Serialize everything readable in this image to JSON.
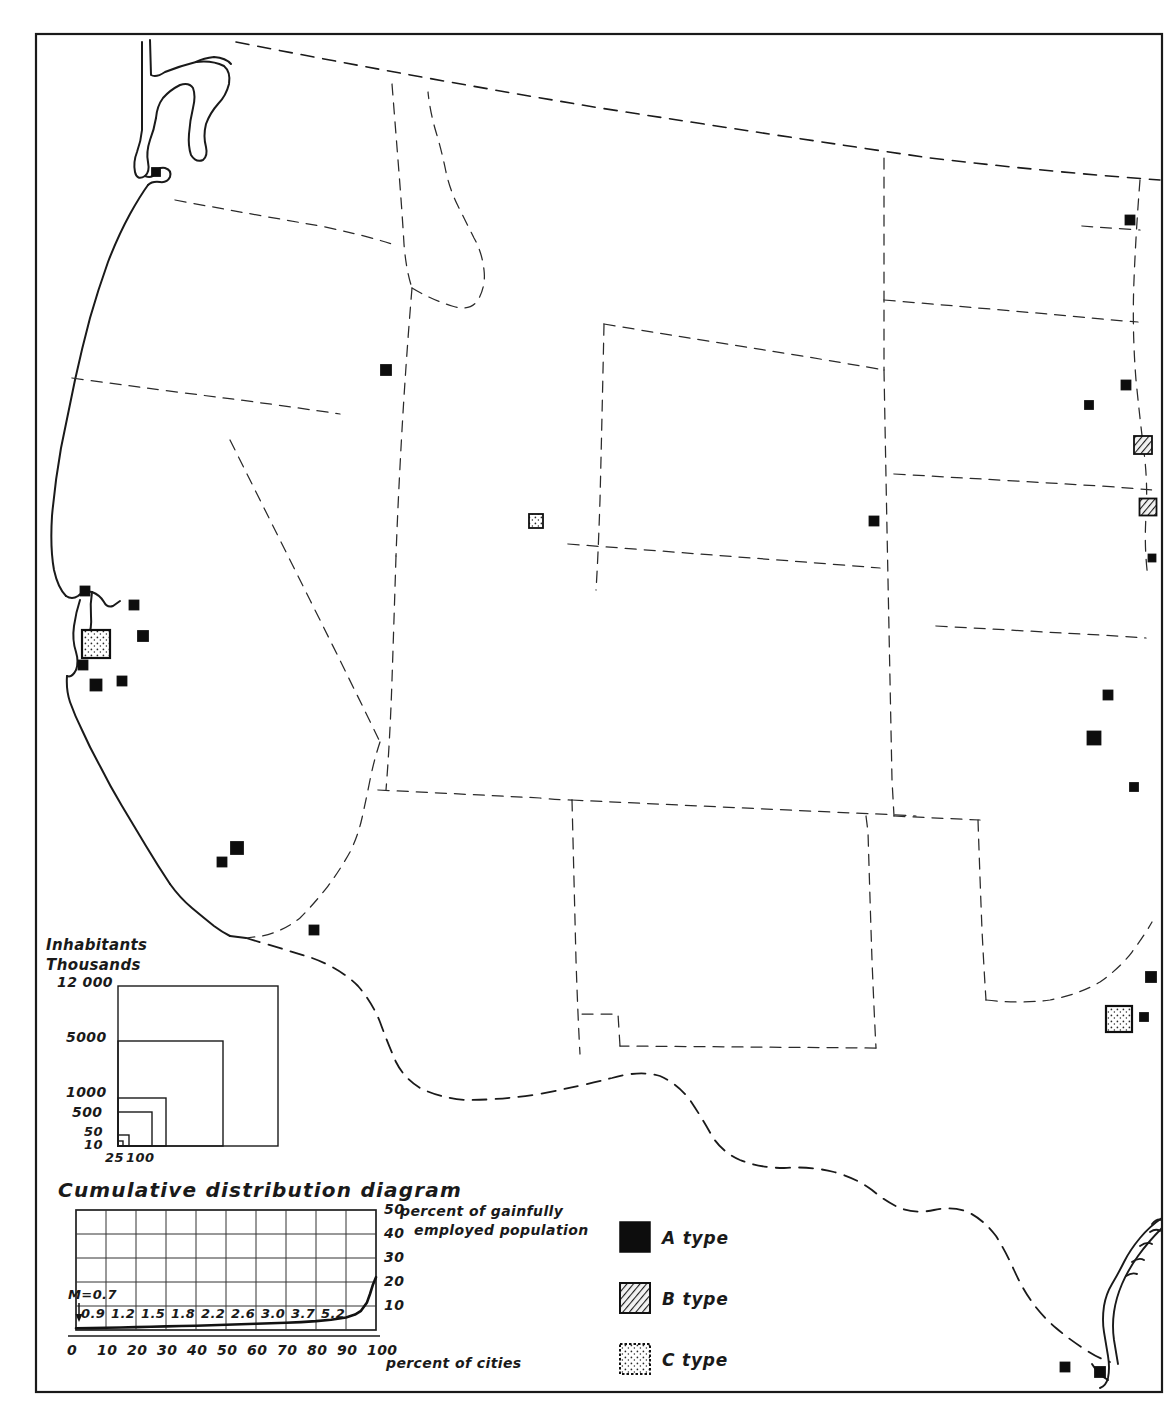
{
  "figure": {
    "kind": "map-with-legends",
    "region": "Western United States",
    "frame_color": "#1a1a1a",
    "background": "#ffffff"
  },
  "inhabitants_legend": {
    "title_line1": "Inhabitants",
    "title_line2": "Thousands",
    "vertical_labels": [
      "12 000",
      "5000",
      "1000",
      "500",
      "50",
      "10"
    ],
    "horizontal_labels": [
      "25",
      "100"
    ],
    "squares": [
      {
        "value": "12 000",
        "side": 160
      },
      {
        "value": "5000",
        "side": 105
      },
      {
        "value": "1000",
        "side": 48
      },
      {
        "value": "500",
        "side": 34
      },
      {
        "value": "50",
        "side": 11
      },
      {
        "value": "10",
        "side": 5
      }
    ]
  },
  "chart_data": {
    "type": "line",
    "title": "Cumulative distribution diagram",
    "xlabel": "percent of cities",
    "ylabel_line1": "percent of gainfully",
    "ylabel_line2": "employed population",
    "xlim": [
      0,
      100
    ],
    "ylim": [
      0,
      50
    ],
    "xticks": [
      "0",
      "10",
      "20",
      "30",
      "40",
      "50",
      "60",
      "70",
      "80",
      "90",
      "100"
    ],
    "yticks": [
      "10",
      "20",
      "30",
      "40",
      "50"
    ],
    "grid": true,
    "legend": "none",
    "annotation": "M=0.7",
    "point_labels": [
      "0.9",
      "1.2",
      "1.5",
      "1.8",
      "2.2",
      "2.6",
      "3.0",
      "3.7",
      "5.2"
    ],
    "x": [
      0,
      5,
      10,
      15,
      20,
      25,
      30,
      35,
      40,
      45,
      50,
      55,
      60,
      65,
      70,
      75,
      80,
      85,
      90,
      93,
      95,
      97,
      98,
      99,
      100
    ],
    "y": [
      0.7,
      0.8,
      0.9,
      1.05,
      1.2,
      1.35,
      1.5,
      1.65,
      1.8,
      2.0,
      2.2,
      2.4,
      2.6,
      2.8,
      3.0,
      3.3,
      3.7,
      4.3,
      5.2,
      6.4,
      8.0,
      11.5,
      15.0,
      19.0,
      22.0
    ]
  },
  "type_legend": {
    "items": [
      {
        "key": "A",
        "label": "A type",
        "pattern": "solid-black",
        "color": "#0d0d0d"
      },
      {
        "key": "B",
        "label": "B type",
        "pattern": "diagonal-hatch",
        "color": "#3a3a3a"
      },
      {
        "key": "C",
        "label": "C type",
        "pattern": "stipple-dots",
        "color": "#ffffff"
      }
    ]
  },
  "map_symbols": [
    {
      "name": "portland-astoria",
      "type": "A",
      "x": 156,
      "y": 172,
      "size": 8
    },
    {
      "name": "boise",
      "type": "A",
      "x": 386,
      "y": 370,
      "size": 10
    },
    {
      "name": "salt-lake-city",
      "type": "C",
      "x": 536,
      "y": 521,
      "size": 14
    },
    {
      "name": "sacramento",
      "type": "A",
      "x": 134,
      "y": 605,
      "size": 9
    },
    {
      "name": "reno",
      "type": "A",
      "x": 143,
      "y": 636,
      "size": 10
    },
    {
      "name": "san-francisco-bay",
      "type": "C",
      "x": 96,
      "y": 644,
      "size": 28
    },
    {
      "name": "san-jose",
      "type": "A",
      "x": 83,
      "y": 665,
      "size": 9
    },
    {
      "name": "stockton",
      "type": "A",
      "x": 122,
      "y": 681,
      "size": 9
    },
    {
      "name": "fresno",
      "type": "A",
      "x": 96,
      "y": 685,
      "size": 11
    },
    {
      "name": "bakersfield",
      "type": "A",
      "x": 85,
      "y": 591,
      "size": 9
    },
    {
      "name": "los-angeles",
      "type": "A",
      "x": 237,
      "y": 848,
      "size": 12
    },
    {
      "name": "san-diego",
      "type": "A",
      "x": 222,
      "y": 862,
      "size": 9
    },
    {
      "name": "tucson",
      "type": "A",
      "x": 314,
      "y": 930,
      "size": 9
    },
    {
      "name": "denver",
      "type": "A",
      "x": 874,
      "y": 521,
      "size": 9
    },
    {
      "name": "billings",
      "type": "A",
      "x": 1130,
      "y": 220,
      "size": 9
    },
    {
      "name": "bismarck",
      "type": "A",
      "x": 1126,
      "y": 385,
      "size": 9
    },
    {
      "name": "rapid-city",
      "type": "A",
      "x": 1089,
      "y": 405,
      "size": 8
    },
    {
      "name": "omaha",
      "type": "B",
      "x": 1143,
      "y": 445,
      "size": 18
    },
    {
      "name": "kansas-city",
      "type": "B",
      "x": 1148,
      "y": 507,
      "size": 17
    },
    {
      "name": "topeka",
      "type": "A",
      "x": 1152,
      "y": 558,
      "size": 7
    },
    {
      "name": "wichita",
      "type": "A",
      "x": 1108,
      "y": 695,
      "size": 9
    },
    {
      "name": "oklahoma-city",
      "type": "A",
      "x": 1094,
      "y": 738,
      "size": 13
    },
    {
      "name": "tulsa-east",
      "type": "A",
      "x": 1134,
      "y": 787,
      "size": 8
    },
    {
      "name": "shreveport",
      "type": "A",
      "x": 1151,
      "y": 977,
      "size": 10
    },
    {
      "name": "dallas-fort-worth",
      "type": "C",
      "x": 1119,
      "y": 1019,
      "size": 26
    },
    {
      "name": "houston-east",
      "type": "A",
      "x": 1144,
      "y": 1017,
      "size": 8
    },
    {
      "name": "brownsville-a",
      "type": "A",
      "x": 1065,
      "y": 1367,
      "size": 9
    },
    {
      "name": "brownsville-b",
      "type": "A",
      "x": 1100,
      "y": 1372,
      "size": 10
    }
  ]
}
